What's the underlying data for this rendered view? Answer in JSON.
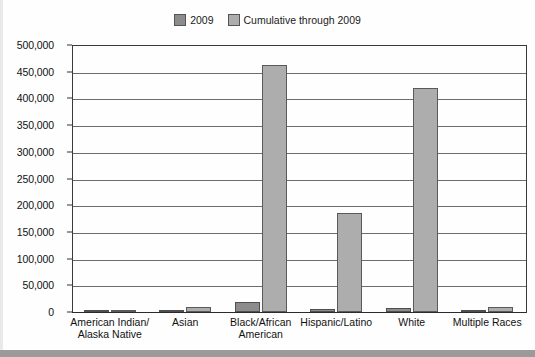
{
  "chart_data": {
    "type": "bar",
    "title": "",
    "xlabel": "",
    "ylabel": "",
    "ylim": [
      0,
      500000
    ],
    "grid": true,
    "legend_position": "top-center",
    "categories": [
      "American Indian/\nAlaska Native",
      "Asian",
      "Black/African\nAmerican",
      "Hispanic/Latino",
      "White",
      "Multiple Races"
    ],
    "series": [
      {
        "name": "2009",
        "color": "#8c8c8c",
        "values": [
          500,
          700,
          18000,
          5500,
          7000,
          900
        ]
      },
      {
        "name": "Cumulative through 2009",
        "color": "#adadad",
        "values": [
          3000,
          9500,
          463000,
          185000,
          420000,
          9000
        ]
      }
    ],
    "y_ticks": [
      "0",
      "50,000",
      "100,000",
      "150,000",
      "200,000",
      "250,000",
      "300,000",
      "350,000",
      "400,000",
      "450,000",
      "500,000"
    ],
    "y_tick_values": [
      0,
      50000,
      100000,
      150000,
      200000,
      250000,
      300000,
      350000,
      400000,
      450000,
      500000
    ]
  },
  "legend": {
    "entries": [
      {
        "label": "2009",
        "color": "#8c8c8c"
      },
      {
        "label": "Cumulative through 2009",
        "color": "#adadad"
      }
    ]
  }
}
